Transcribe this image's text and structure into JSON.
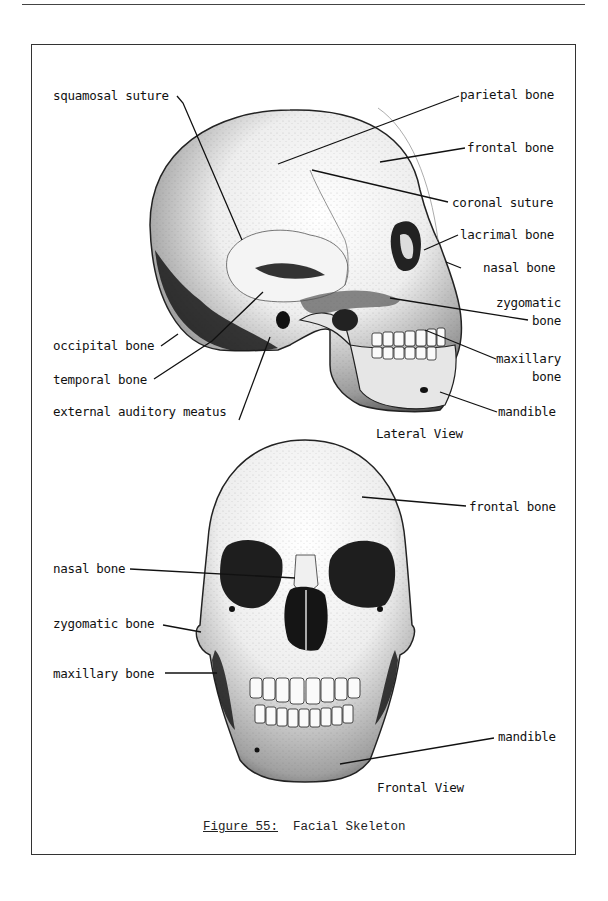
{
  "page": {
    "figure_number": "Figure 55:",
    "figure_title": "  Facial Skeleton"
  },
  "lateral_view": {
    "title": "Lateral View",
    "labels": {
      "squamosal_suture": "squamosal suture",
      "parietal_bone": "parietal bone",
      "frontal_bone": "frontal bone",
      "coronal_suture": "coronal suture",
      "lacrimal_bone": "lacrimal bone",
      "nasal_bone": "nasal bone",
      "zygomatic_bone_line1": "zygomatic",
      "zygomatic_bone_line2": "bone",
      "maxillary_bone_line1": "maxillary",
      "maxillary_bone_line2": "bone",
      "mandible": "mandible",
      "occipital_bone": "occipital bone",
      "temporal_bone": "temporal bone",
      "external_auditory_meatus": "external auditory meatus"
    }
  },
  "frontal_view": {
    "title": "Frontal View",
    "labels": {
      "frontal_bone": "frontal bone",
      "nasal_bone": "nasal bone",
      "zygomatic_bone": "zygomatic bone",
      "maxillary_bone": "maxillary bone",
      "mandible": "mandible"
    }
  }
}
